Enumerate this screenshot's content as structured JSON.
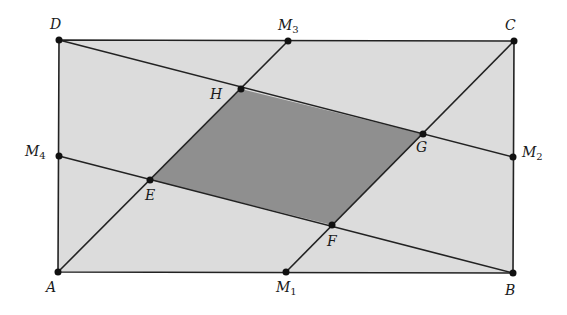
{
  "diagram": {
    "colors": {
      "background": "#ffffff",
      "rectangle_fill": "#dcdcdc",
      "inner_fill": "#8f8f8f",
      "stroke": "#222222",
      "point": "#111111"
    },
    "rectangle": {
      "vertices": [
        "A",
        "B",
        "C",
        "D"
      ]
    },
    "inner_quadrilateral": {
      "vertices": [
        "E",
        "F",
        "G",
        "H"
      ],
      "shaded": true
    },
    "segments": [
      {
        "from": "D",
        "to": "M2"
      },
      {
        "from": "M4",
        "to": "B"
      },
      {
        "from": "A",
        "to": "M3"
      },
      {
        "from": "M1",
        "to": "C"
      }
    ],
    "points": [
      {
        "id": "A",
        "label": "A",
        "sub": "",
        "x": 58,
        "y": 272
      },
      {
        "id": "B",
        "label": "B",
        "sub": "",
        "x": 513,
        "y": 273
      },
      {
        "id": "C",
        "label": "C",
        "sub": "",
        "x": 514,
        "y": 41
      },
      {
        "id": "D",
        "label": "D",
        "sub": "",
        "x": 59,
        "y": 40
      },
      {
        "id": "M1",
        "label": "M",
        "sub": "1",
        "x": 286,
        "y": 272
      },
      {
        "id": "M2",
        "label": "M",
        "sub": "2",
        "x": 513,
        "y": 157
      },
      {
        "id": "M3",
        "label": "M",
        "sub": "3",
        "x": 288,
        "y": 41
      },
      {
        "id": "M4",
        "label": "M",
        "sub": "4",
        "x": 59,
        "y": 156
      },
      {
        "id": "E",
        "label": "E",
        "sub": "",
        "x": 150,
        "y": 180
      },
      {
        "id": "F",
        "label": "F",
        "sub": "",
        "x": 332,
        "y": 225
      },
      {
        "id": "G",
        "label": "G",
        "sub": "",
        "x": 423,
        "y": 134
      },
      {
        "id": "H",
        "label": "H",
        "sub": "",
        "x": 241,
        "y": 89
      }
    ],
    "labels": {
      "A": {
        "text": "A",
        "sub": ""
      },
      "B": {
        "text": "B",
        "sub": ""
      },
      "C": {
        "text": "C",
        "sub": ""
      },
      "D": {
        "text": "D",
        "sub": ""
      },
      "M1": {
        "text": "M",
        "sub": "1"
      },
      "M2": {
        "text": "M",
        "sub": "2"
      },
      "M3": {
        "text": "M",
        "sub": "3"
      },
      "M4": {
        "text": "M",
        "sub": "4"
      },
      "E": {
        "text": "E",
        "sub": ""
      },
      "F": {
        "text": "F",
        "sub": ""
      },
      "G": {
        "text": "G",
        "sub": ""
      },
      "H": {
        "text": "H",
        "sub": ""
      }
    }
  }
}
